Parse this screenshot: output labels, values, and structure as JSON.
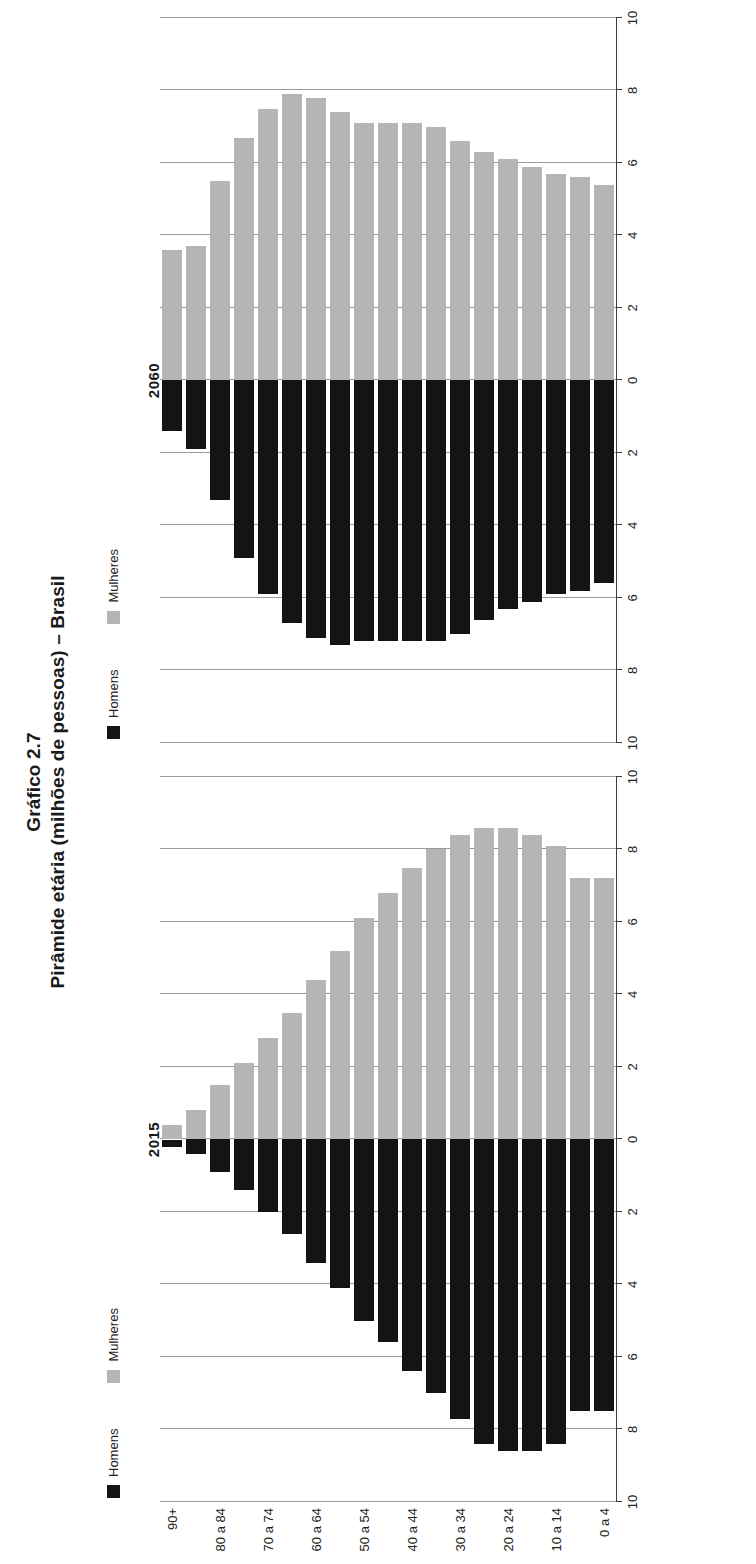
{
  "title": {
    "line1": "Gráfico 2.7",
    "line2": "Pirâmide etária (milhões de pessoas) – Brasil"
  },
  "legend": {
    "homens_label": "Homens",
    "mulheres_label": "Mulheres",
    "homens_color": "#141414",
    "mulheres_color": "#b5b5b5"
  },
  "axes": {
    "category_axis_title": "Idade(anos)",
    "value_tick_labels": [
      "10",
      "8",
      "6",
      "4",
      "2",
      "0",
      "2",
      "4",
      "6",
      "8",
      "10"
    ]
  },
  "panels": [
    {
      "year": "2015"
    },
    {
      "year": "2060"
    }
  ],
  "chart_data": {
    "type": "bar",
    "title": "Pirâmide etária (milhões de pessoas) – Brasil",
    "subtitle": "Gráfico 2.7",
    "xlabel": "milhões de pessoas",
    "ylabel": "Idade(anos)",
    "xlim": [
      -10,
      10
    ],
    "grid": true,
    "legend_position": "top-left",
    "orientation": "population-pyramid",
    "tick_labels": [
      "10",
      "8",
      "6",
      "4",
      "2",
      "0",
      "2",
      "4",
      "6",
      "8",
      "10"
    ],
    "categories": [
      "0 a 4",
      "5 a 9",
      "10 a 14",
      "15 a 19",
      "20 a 24",
      "25 a 29",
      "30 a 34",
      "35 a 39",
      "40 a 44",
      "45 a 49",
      "50 a 54",
      "55 a 59",
      "60 a 64",
      "65 a 69",
      "70 a 74",
      "75 a 79",
      "80 a 84",
      "85 a 89",
      "90+"
    ],
    "displayed_category_labels": [
      "0 a 4",
      "10 a 14",
      "20 a 24",
      "30 a 34",
      "40 a 44",
      "50 a 54",
      "60 a 64",
      "70 a 74",
      "80 a 84",
      "90+"
    ],
    "panels": [
      {
        "year": "2015",
        "series": [
          {
            "name": "Homens",
            "color": "#141414",
            "values": [
              7.5,
              7.5,
              8.4,
              8.6,
              8.6,
              8.4,
              7.7,
              7.0,
              6.4,
              5.6,
              5.0,
              4.1,
              3.4,
              2.6,
              2.0,
              1.4,
              0.9,
              0.4,
              0.2
            ]
          },
          {
            "name": "Mulheres",
            "color": "#b5b5b5",
            "values": [
              7.2,
              7.2,
              8.1,
              8.4,
              8.6,
              8.6,
              8.4,
              8.0,
              7.5,
              6.8,
              6.1,
              5.2,
              4.4,
              3.5,
              2.8,
              2.1,
              1.5,
              0.8,
              0.4
            ]
          }
        ]
      },
      {
        "year": "2060",
        "series": [
          {
            "name": "Homens",
            "color": "#141414",
            "values": [
              5.6,
              5.8,
              5.9,
              6.1,
              6.3,
              6.6,
              7.0,
              7.2,
              7.2,
              7.2,
              7.2,
              7.3,
              7.1,
              6.7,
              5.9,
              4.9,
              3.3,
              1.9,
              1.4
            ]
          },
          {
            "name": "Mulheres",
            "color": "#b5b5b5",
            "values": [
              5.4,
              5.6,
              5.7,
              5.9,
              6.1,
              6.3,
              6.6,
              7.0,
              7.1,
              7.1,
              7.1,
              7.4,
              7.8,
              7.9,
              7.5,
              6.7,
              5.5,
              3.7,
              3.6
            ]
          }
        ]
      }
    ]
  }
}
